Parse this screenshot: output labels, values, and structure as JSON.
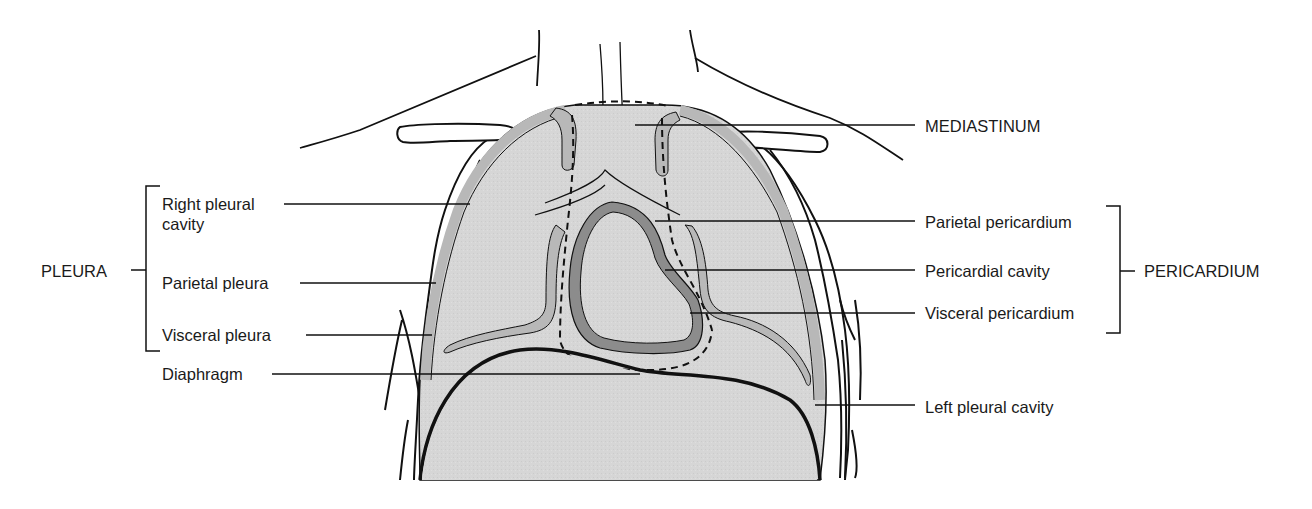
{
  "figure": {
    "type": "anatomical-diagram",
    "colors": {
      "background": "#ffffff",
      "tissue_fill": "#d6d6d6",
      "pleura_band": "#b8b8b8",
      "pericardium_band": "#8c8c8c",
      "outline": "#111111"
    }
  },
  "groups": {
    "pleura": {
      "label": "PLEURA",
      "members": [
        "Right pleural cavity",
        "Parietal pleura",
        "Visceral pleura"
      ]
    },
    "pericardium": {
      "label": "PERICARDIUM",
      "members": [
        "Parietal pericardium",
        "Pericardial cavity",
        "Visceral pericardium"
      ]
    }
  },
  "labels": {
    "left": [
      {
        "id": "right-pleural-cavity",
        "line1": "Right pleural",
        "line2": "cavity"
      },
      {
        "id": "parietal-pleura",
        "line1": "Parietal pleura"
      },
      {
        "id": "visceral-pleura",
        "line1": "Visceral pleura"
      },
      {
        "id": "diaphragm",
        "line1": "Diaphragm"
      }
    ],
    "right": [
      {
        "id": "mediastinum",
        "line1": "MEDIASTINUM"
      },
      {
        "id": "parietal-pericardium",
        "line1": "Parietal pericardium"
      },
      {
        "id": "pericardial-cavity",
        "line1": "Pericardial cavity"
      },
      {
        "id": "visceral-pericardium",
        "line1": "Visceral pericardium"
      },
      {
        "id": "left-pleural-cavity",
        "line1": "Left pleural cavity"
      }
    ]
  }
}
